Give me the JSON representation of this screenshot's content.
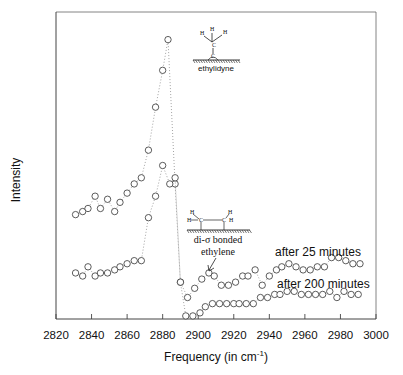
{
  "chart_data": {
    "type": "scatter",
    "title": "",
    "xlabel": "Frequency (in cm",
    "xlabel_superscript": "-1",
    "xlabel_suffix": ")",
    "ylabel": "Intensity",
    "xlim": [
      2820,
      3000
    ],
    "ylim": [
      0,
      100
    ],
    "x_ticks": [
      2820,
      2840,
      2860,
      2880,
      2900,
      2920,
      2940,
      2960,
      2980,
      3000
    ],
    "y_ticks_labeled": false,
    "grid": false,
    "legend": "none",
    "series": [
      {
        "name": "after 25 minutes",
        "marker": "open-circle",
        "line": "dotted",
        "x": [
          2831,
          2835,
          2838,
          2842,
          2845,
          2849,
          2853,
          2856,
          2860,
          2864,
          2868,
          2872,
          2876,
          2880,
          2883,
          2887,
          2890,
          2894,
          2898,
          2902,
          2906,
          2909,
          2913,
          2917,
          2921,
          2925,
          2928,
          2932,
          2936,
          2940,
          2944,
          2947,
          2951,
          2955,
          2959,
          2963,
          2967,
          2971,
          2975,
          2979,
          2983,
          2987,
          2991
        ],
        "y": [
          34,
          35,
          36,
          40,
          36,
          39,
          35,
          38,
          41,
          44,
          46,
          55,
          69,
          81,
          91,
          44,
          12,
          7,
          10,
          13,
          15,
          14,
          11,
          11,
          12,
          14,
          14,
          16,
          11,
          14,
          16,
          17,
          18,
          17,
          16,
          16,
          17,
          17,
          20,
          20,
          19,
          18,
          18
        ]
      },
      {
        "name": "after 200 minutes",
        "marker": "open-circle",
        "line": "dotted",
        "x": [
          2831,
          2835,
          2838,
          2842,
          2845,
          2849,
          2853,
          2856,
          2860,
          2864,
          2868,
          2872,
          2876,
          2880,
          2884,
          2887,
          2890,
          2893,
          2897,
          2901,
          2904,
          2908,
          2912,
          2916,
          2920,
          2923,
          2927,
          2931,
          2935,
          2939,
          2943,
          2946,
          2950,
          2954,
          2958,
          2962,
          2966,
          2970,
          2974,
          2978,
          2982,
          2986,
          2990
        ],
        "y": [
          15,
          14,
          17,
          14,
          15,
          15,
          16,
          17,
          18,
          19,
          19,
          33,
          40,
          50,
          44,
          46,
          12,
          1,
          1,
          2,
          4,
          5,
          5,
          5,
          5,
          5,
          5,
          5,
          7,
          7,
          8,
          8,
          9,
          9,
          8,
          8,
          8,
          8,
          9,
          7,
          9,
          8,
          8
        ]
      }
    ],
    "annotations": [
      {
        "text": "ethylidyne",
        "kind": "structure-label",
        "near_x": 2900,
        "near_y": 92
      },
      {
        "text": "di-σ bonded",
        "kind": "structure-label",
        "near_x": 2910,
        "near_y": 30
      },
      {
        "text": "ethylene",
        "kind": "structure-label",
        "near_x": 2912,
        "near_y": 23
      },
      {
        "text": "after 25 minutes",
        "kind": "series-label",
        "near_x": 2960,
        "near_y": 22
      },
      {
        "text": "after 200 minutes",
        "kind": "series-label",
        "near_x": 2963,
        "near_y": 11
      }
    ]
  },
  "structures": {
    "ethylidyne": {
      "atoms": [
        "H",
        "H",
        "H",
        "C",
        "C"
      ],
      "label": "ethylidyne"
    },
    "di_sigma_ethylene": {
      "atoms": [
        "H",
        "H",
        "C",
        "C",
        "H",
        "H"
      ],
      "label_line1": "di-σ bonded",
      "label_line2": "ethylene"
    }
  }
}
